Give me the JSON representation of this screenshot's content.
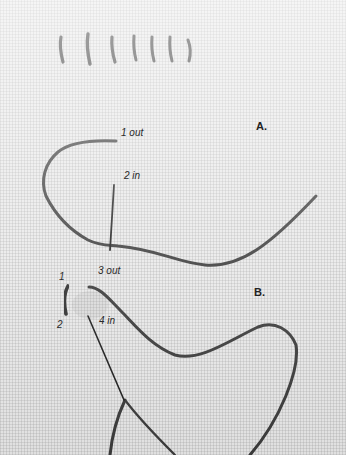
{
  "image": {
    "subject": "back stitch embroidery on linen fabric",
    "colors": {
      "fabric": "#e9e9e9",
      "thread": "#3a3a3a",
      "needle": "#1e1e1e",
      "label_text": "#2a2a2a"
    }
  },
  "labels": {
    "section_a": "A.",
    "section_b": "B.",
    "a_step_1": "1 out",
    "a_step_2": "2 in",
    "a_step_3": "3 out",
    "b_point_1": "1",
    "b_point_2": "2",
    "b_step_4": "4 in"
  },
  "top_row": {
    "completed_stitch_count": 7
  }
}
